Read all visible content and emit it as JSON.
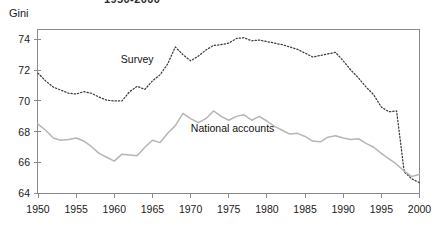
{
  "figure": {
    "title_partial": "1950-2000",
    "y_axis_label": "Gini"
  },
  "chart_data": {
    "type": "line",
    "title": "1950-2000",
    "xlabel": "",
    "ylabel": "Gini",
    "xlim": [
      1950,
      2000
    ],
    "ylim": [
      64,
      74.6
    ],
    "yticks": [
      64,
      66,
      68,
      70,
      72,
      74
    ],
    "ytick_labels": [
      "64",
      "66",
      "68",
      "70",
      "72",
      "74"
    ],
    "xticks": [
      1950,
      1955,
      1960,
      1965,
      1970,
      1975,
      1980,
      1985,
      1990,
      1995,
      2000
    ],
    "xtick_labels": [
      "1950",
      "1955",
      "1960",
      "1965",
      "1970",
      "1975",
      "1980",
      "1985",
      "1990",
      "1995",
      "2000"
    ],
    "grid": false,
    "legend_position": "inline-annotation",
    "x": [
      1950,
      1951,
      1952,
      1953,
      1954,
      1955,
      1956,
      1957,
      1958,
      1959,
      1960,
      1961,
      1962,
      1963,
      1964,
      1965,
      1966,
      1967,
      1968,
      1969,
      1970,
      1971,
      1972,
      1973,
      1974,
      1975,
      1976,
      1977,
      1978,
      1979,
      1980,
      1981,
      1982,
      1983,
      1984,
      1985,
      1986,
      1987,
      1988,
      1989,
      1990,
      1991,
      1992,
      1993,
      1994,
      1995,
      1996,
      1997,
      1998,
      1999,
      2000
    ],
    "series": [
      {
        "name": "Survey",
        "style": "dotted",
        "color": "#3a3a3a",
        "label_x": 1963.0,
        "label_y": 72.45,
        "values": [
          71.8,
          71.3,
          70.9,
          70.7,
          70.5,
          70.45,
          70.6,
          70.5,
          70.25,
          70.05,
          70.0,
          70.0,
          70.6,
          70.95,
          70.75,
          71.3,
          71.7,
          72.4,
          73.5,
          73.0,
          72.6,
          72.9,
          73.3,
          73.6,
          73.65,
          73.75,
          74.05,
          74.1,
          73.9,
          73.95,
          73.85,
          73.75,
          73.65,
          73.5,
          73.35,
          73.1,
          72.85,
          72.95,
          73.05,
          73.15,
          72.6,
          72.0,
          71.5,
          70.9,
          70.4,
          69.6,
          69.3,
          69.35,
          65.4,
          64.95,
          64.7
        ]
      },
      {
        "name": "National accounts",
        "style": "solid",
        "color": "#b6b6b6",
        "label_x": 1975.5,
        "label_y": 68.0,
        "values": [
          68.5,
          68.1,
          67.6,
          67.45,
          67.5,
          67.6,
          67.4,
          67.05,
          66.6,
          66.35,
          66.1,
          66.55,
          66.5,
          66.45,
          67.0,
          67.45,
          67.3,
          67.9,
          68.4,
          69.2,
          68.85,
          68.6,
          68.85,
          69.35,
          69.0,
          68.75,
          69.0,
          69.1,
          68.75,
          69.0,
          68.7,
          68.35,
          68.1,
          67.85,
          67.9,
          67.7,
          67.4,
          67.35,
          67.65,
          67.75,
          67.6,
          67.5,
          67.55,
          67.25,
          67.0,
          66.6,
          66.25,
          65.9,
          65.45,
          65.1,
          65.25
        ]
      }
    ]
  }
}
